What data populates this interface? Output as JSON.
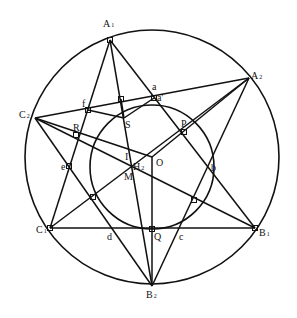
{
  "diagram": {
    "type": "geometry",
    "stroke_color": "#111111",
    "background": "#ffffff",
    "circumcircle": {
      "cx": 152,
      "cy": 157,
      "r": 127
    },
    "incircle": {
      "cx": 152,
      "cy": 167,
      "r": 62
    },
    "points": {
      "A1": {
        "x": 110,
        "y": 40
      },
      "A2": {
        "x": 249,
        "y": 78
      },
      "C2": {
        "x": 35,
        "y": 118
      },
      "C1": {
        "x": 50,
        "y": 228
      },
      "B1": {
        "x": 255,
        "y": 228
      },
      "B2": {
        "x": 152,
        "y": 286
      },
      "O": {
        "x": 152,
        "y": 157
      },
      "Q": {
        "x": 152,
        "y": 229
      },
      "H2": {
        "x": 131,
        "y": 166
      },
      "S": {
        "x": 124,
        "y": 118
      },
      "R": {
        "x": 76,
        "y": 135
      },
      "P": {
        "x": 184,
        "y": 132
      },
      "f": {
        "x": 88,
        "y": 110
      },
      "a": {
        "x": 154,
        "y": 93
      },
      "a_prime": {
        "x": 154,
        "y": 98
      },
      "e": {
        "x": 69,
        "y": 166
      },
      "b": {
        "x": 213,
        "y": 166
      },
      "d": {
        "x": 111,
        "y": 228
      },
      "c": {
        "x": 181,
        "y": 228
      },
      "T1": {
        "x": 121,
        "y": 99
      },
      "T2": {
        "x": 93,
        "y": 197
      },
      "T3": {
        "x": 194,
        "y": 200
      }
    },
    "labels": [
      {
        "id": "A1",
        "text": "A",
        "sub": "1",
        "x": 103,
        "y": 27
      },
      {
        "id": "A2",
        "text": "A",
        "sub": "2",
        "x": 251,
        "y": 79
      },
      {
        "id": "C2",
        "text": "C",
        "sub": "2",
        "x": 19,
        "y": 118
      },
      {
        "id": "C1",
        "text": "C",
        "sub": "1",
        "x": 36,
        "y": 233
      },
      {
        "id": "B1",
        "text": "B",
        "sub": "1",
        "x": 259,
        "y": 236
      },
      {
        "id": "B2",
        "text": "B",
        "sub": "2",
        "x": 146,
        "y": 298
      },
      {
        "id": "a",
        "text": "a",
        "sub": "",
        "x": 152,
        "y": 90
      },
      {
        "id": "a_prime",
        "text": "a'",
        "sub": "",
        "x": 157,
        "y": 101
      },
      {
        "id": "f",
        "text": "f",
        "sub": "",
        "x": 82,
        "y": 107
      },
      {
        "id": "S",
        "text": "S",
        "sub": "",
        "x": 125,
        "y": 128
      },
      {
        "id": "R",
        "text": "R",
        "sub": "",
        "x": 73,
        "y": 131
      },
      {
        "id": "P",
        "text": "P",
        "sub": "",
        "x": 181,
        "y": 127
      },
      {
        "id": "I",
        "text": "I",
        "sub": "",
        "x": 125,
        "y": 160
      },
      {
        "id": "H2",
        "text": "H",
        "sub": "2",
        "x": 133,
        "y": 170
      },
      {
        "id": "O",
        "text": "O",
        "sub": "",
        "x": 156,
        "y": 166
      },
      {
        "id": "M",
        "text": "M",
        "sub": "",
        "x": 124,
        "y": 180
      },
      {
        "id": "e",
        "text": "e",
        "sub": "",
        "x": 61,
        "y": 170
      },
      {
        "id": "b",
        "text": "b",
        "sub": "",
        "x": 211,
        "y": 171
      },
      {
        "id": "d",
        "text": "d",
        "sub": "",
        "x": 107,
        "y": 240
      },
      {
        "id": "Q",
        "text": "Q",
        "sub": "",
        "x": 154,
        "y": 240
      },
      {
        "id": "c",
        "text": "c",
        "sub": "",
        "x": 179,
        "y": 240
      }
    ],
    "segments": [
      [
        "A1",
        "B1"
      ],
      [
        "A1",
        "C1"
      ],
      [
        "A1",
        "B2"
      ],
      [
        "A2",
        "C2"
      ],
      [
        "A2",
        "C1"
      ],
      [
        "A2",
        "B2"
      ],
      [
        "C2",
        "B1"
      ],
      [
        "C2",
        "B2"
      ],
      [
        "C1",
        "B1"
      ],
      [
        "A2",
        "O"
      ],
      [
        "O",
        "Q"
      ],
      [
        "Q",
        "B2"
      ],
      [
        "C2",
        "O"
      ],
      [
        "f",
        "S"
      ],
      [
        "S",
        "a_prime"
      ],
      [
        "S",
        "T1"
      ]
    ],
    "right_angle_marks": [
      "A1",
      "C1",
      "B1",
      "f",
      "a_prime",
      "R",
      "P",
      "Q",
      "T1",
      "T2",
      "T3",
      "e"
    ]
  }
}
